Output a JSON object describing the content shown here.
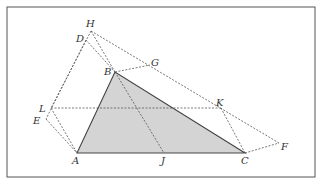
{
  "diagram": {
    "frame": {
      "x": 7,
      "y": 7,
      "width": 308,
      "height": 170,
      "stroke": "#555555"
    },
    "triangle": {
      "vertices": [
        "A",
        "B",
        "C"
      ],
      "fill": "#d4d4d4",
      "stroke": "#444444"
    },
    "points": {
      "A": {
        "x": 77,
        "y": 153,
        "label": "A",
        "lx": 72,
        "ly": 164
      },
      "B": {
        "x": 115,
        "y": 72,
        "label": "B",
        "lx": 104,
        "ly": 75
      },
      "C": {
        "x": 245,
        "y": 153,
        "label": "C",
        "lx": 241,
        "ly": 164
      },
      "D": {
        "x": 86,
        "y": 40,
        "label": "D",
        "lx": 76,
        "ly": 42
      },
      "E": {
        "x": 46,
        "y": 119,
        "label": "E",
        "lx": 33,
        "ly": 124
      },
      "F": {
        "x": 279,
        "y": 143,
        "label": "F",
        "lx": 281,
        "ly": 150
      },
      "G": {
        "x": 150,
        "y": 65,
        "label": "G",
        "lx": 151,
        "ly": 66
      },
      "H": {
        "x": 91,
        "y": 31,
        "label": "H",
        "lx": 86,
        "ly": 27
      },
      "J": {
        "x": 164,
        "y": 153,
        "label": "J",
        "lx": 161,
        "ly": 164
      },
      "K": {
        "x": 221,
        "y": 108,
        "label": "K",
        "lx": 216,
        "ly": 106
      },
      "L": {
        "x": 51,
        "y": 108,
        "label": "L",
        "lx": 39,
        "ly": 112
      }
    },
    "dashed_segments": [
      [
        "H",
        "F"
      ],
      [
        "B",
        "G"
      ],
      [
        "H",
        "B"
      ],
      [
        "D",
        "B"
      ],
      [
        "B",
        "J"
      ],
      [
        "L",
        "K"
      ],
      [
        "K",
        "C"
      ],
      [
        "C",
        "F"
      ],
      [
        "H",
        "L"
      ],
      [
        "D",
        "E"
      ],
      [
        "L",
        "A"
      ],
      [
        "E",
        "A"
      ]
    ]
  }
}
